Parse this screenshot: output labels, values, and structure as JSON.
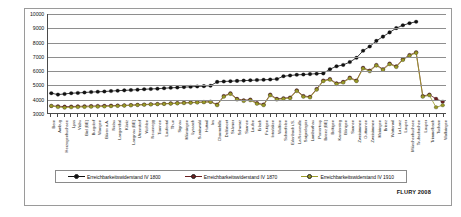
{
  "figure": {
    "credit": "FLURY 2008"
  },
  "legend": {
    "items": [
      {
        "label": "Erreichbarkeitswiderstand IV 1800",
        "color": "#111111"
      },
      {
        "label": "Erreichbarkeitswiderstand IV 1870",
        "color": "#6b1f1f"
      },
      {
        "label": "Erreichbarkeitswiderstand IV 1910",
        "color": "#9a9a28"
      }
    ]
  },
  "chart_data": {
    "type": "line",
    "title": "",
    "xlabel": "",
    "ylabel": "",
    "ylim": [
      3000,
      10000
    ],
    "yticks": [
      3000,
      4000,
      5000,
      6000,
      7000,
      8000,
      9000,
      10000
    ],
    "grid": true,
    "legend_position": "bottom",
    "categories": [
      "Bern",
      "Ambug",
      "Herzogenbuchsee",
      "Lyss",
      "Visbu",
      "Biel (BE)",
      "Burgdorf",
      "Wangen",
      "Büren a.A.",
      "Nidau",
      "Langenthal",
      "Köniz",
      "Langnau (BE)",
      "Utzenstorf",
      "Wohlen",
      "Neuenegg",
      "Trannen",
      "Laufental",
      "Thun",
      "Signau",
      "Münsingen",
      "Lyssach",
      "Sumiswald",
      "Huttwil",
      "Ins",
      "Charmebille",
      "Delémont",
      "St-Imier",
      "Schwarz",
      "Saanen",
      "Laufen",
      "Erlach",
      "Frutigen",
      "Interlaken",
      "Wolfern",
      "Schwefelen",
      "Erlenbach i.S.",
      "La Neuveville",
      "Saignelegier",
      "Lamberthau",
      "Porrentruy",
      "Brienz (BE)",
      "Boltigen",
      "Kandersteg",
      "Bönigen",
      "Saanen",
      "Zweisimmen",
      "Guttannen",
      "Zweisimmen",
      "Meiringen",
      "Brienz",
      "Wattenwil",
      "La Lanz",
      "Lauper",
      "Münchenbuchsee",
      "Trubschachen",
      "Lauper",
      "Trimmelbach",
      "Tscharn",
      "Walkringen"
    ],
    "series": [
      {
        "name": "Erreichbarkeitswiderstand IV 1800",
        "color": "#111111",
        "values": [
          4400,
          4300,
          4350,
          4400,
          4420,
          4450,
          4480,
          4500,
          4520,
          4550,
          4580,
          4600,
          4620,
          4650,
          4680,
          4700,
          4720,
          4750,
          4780,
          4800,
          4830,
          4850,
          4880,
          4900,
          4930,
          5200,
          5230,
          5250,
          5270,
          5290,
          5310,
          5330,
          5350,
          5370,
          5400,
          5600,
          5650,
          5700,
          5720,
          5750,
          5780,
          5800,
          6100,
          6300,
          6400,
          6600,
          6900,
          7400,
          7700,
          8100,
          8400,
          8700,
          9000,
          9200,
          9350,
          9450,
          null,
          null,
          null,
          null
        ]
      },
      {
        "name": "Erreichbarkeitswiderstand IV 1870",
        "color": "#6b1f1f",
        "values": [
          3500,
          3480,
          3450,
          3460,
          3470,
          3480,
          3490,
          3500,
          3510,
          3520,
          3530,
          3540,
          3560,
          3580,
          3600,
          3620,
          3640,
          3660,
          3680,
          3700,
          3720,
          3740,
          3760,
          3780,
          3800,
          3600,
          4200,
          4400,
          4000,
          3900,
          3950,
          3700,
          3600,
          4300,
          4000,
          4050,
          4100,
          4600,
          4200,
          4150,
          4700,
          5300,
          5400,
          5100,
          5200,
          5500,
          5300,
          6200,
          6000,
          6400,
          6100,
          6500,
          6300,
          6800,
          7100,
          7300,
          4200,
          4300,
          4000,
          3800
        ]
      },
      {
        "name": "Erreichbarkeitswiderstand IV 1910",
        "color": "#9a9a28",
        "values": [
          3500,
          3420,
          3380,
          3400,
          3420,
          3430,
          3440,
          3450,
          3460,
          3480,
          3500,
          3520,
          3540,
          3560,
          3580,
          3600,
          3620,
          3640,
          3660,
          3680,
          3700,
          3720,
          3740,
          3760,
          3780,
          3550,
          4150,
          4350,
          3950,
          3850,
          3900,
          3650,
          3550,
          4250,
          3950,
          4000,
          4050,
          4550,
          4150,
          4100,
          4650,
          5250,
          5350,
          5050,
          5150,
          5450,
          5250,
          6150,
          5950,
          6350,
          6050,
          6450,
          6250,
          6750,
          7050,
          7250,
          4150,
          4250,
          3400,
          3550
        ]
      }
    ]
  }
}
